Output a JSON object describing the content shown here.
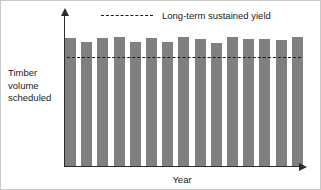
{
  "figure": {
    "background_color": "#ffffff",
    "border_color": "#c9c9c9"
  },
  "axis": {
    "x_title": "Year",
    "y_title_lines": [
      "Timber",
      "volume",
      "scheduled"
    ],
    "y_title_line_1": "Timber",
    "y_title_line_2": "volume",
    "y_title_line_3": "scheduled",
    "axis_color": "#2b2b2b"
  },
  "legend": {
    "position": "top-center",
    "entry_label": "Long-term sustained yield",
    "entry_style": "dashed-line",
    "entry_color": "#1a1a1a"
  },
  "chart_data": {
    "type": "bar",
    "title": "",
    "subtitle": "",
    "xlabel": "Year",
    "ylabel": "Timber volume scheduled",
    "grid": false,
    "legend_position": "top-center",
    "bar_color": "#808080",
    "reference_line": {
      "label": "Long-term sustained yield",
      "value": 100,
      "style": "dashed",
      "color": "#1a1a1a",
      "orientation": "horizontal"
    },
    "xlim": [
      0,
      15
    ],
    "ylim": [
      0,
      112
    ],
    "axis_ticks_shown": false,
    "categories": [
      "1",
      "2",
      "3",
      "4",
      "5",
      "6",
      "7",
      "8",
      "9",
      "10",
      "11",
      "12",
      "13",
      "14",
      "15"
    ],
    "series": [
      {
        "name": "Timber volume scheduled",
        "color": "#808080",
        "values": [
          99,
          96,
          99,
          100,
          96,
          99,
          96,
          100,
          98,
          95,
          100,
          98,
          98,
          97,
          100
        ]
      }
    ]
  }
}
